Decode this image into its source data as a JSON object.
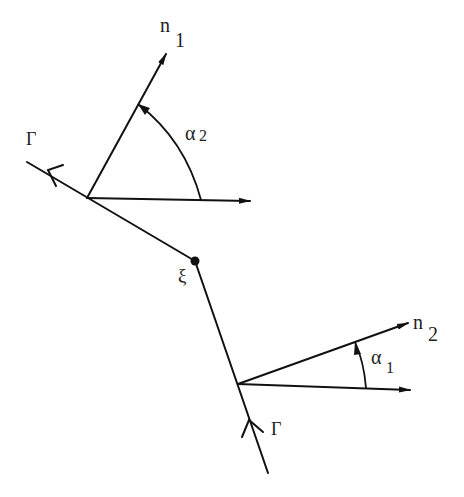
{
  "diagram": {
    "type": "geometry-figure",
    "colors": {
      "ink": "#111111",
      "background": "#ffffff"
    },
    "labels": {
      "n1_base": "n",
      "n1_sub": "1",
      "n2_base": "n",
      "n2_sub": "2",
      "alpha2_base": "α",
      "alpha2_sub": "2",
      "alpha1_base": "α",
      "alpha1_sub": "1",
      "gamma_top": "Γ",
      "gamma_bottom": "Γ",
      "xi": "ξ"
    },
    "points": {
      "gamma_top_end": [
        27,
        162
      ],
      "upper_base": [
        87,
        198
      ],
      "corner_xi": [
        195,
        261
      ],
      "lower_base": [
        238,
        384
      ],
      "gamma_bottom_end": [
        268,
        473
      ],
      "n1_tip": [
        166,
        54
      ],
      "upper_horizontal_tip": [
        250,
        201
      ],
      "n2_tip": [
        408,
        323
      ],
      "lower_horizontal_tip": [
        410,
        390
      ]
    }
  }
}
